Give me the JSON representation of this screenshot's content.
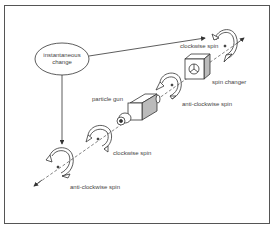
{
  "diagram": {
    "type": "spin-flow",
    "node": {
      "line1": "instantaneous",
      "line2": "change"
    },
    "labels": {
      "clockwise_top": "clockwise spin",
      "spin_changer": "spin changer",
      "particle_gun": "particle gun",
      "anti_clockwise_mid": "anti-clockwise spin",
      "clockwise_low": "clockwise spin",
      "anti_clockwise_bottom": "anti-clockwise spin"
    },
    "colors": {
      "stroke": "#333333",
      "text": "#444444",
      "shade": "#bbbbbb",
      "background": "#ffffff"
    }
  }
}
